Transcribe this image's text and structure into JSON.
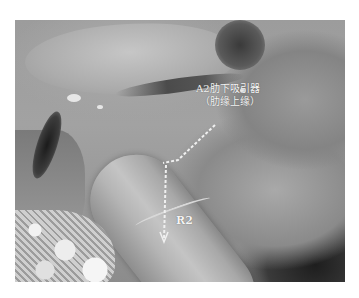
{
  "image": {
    "description": "Grayscale laparoscopic surgical photograph with annotation",
    "annotations": {
      "label_a2_line1": "A2肋下吸引器",
      "label_a2_line2": "（肋缘上缘）",
      "label_r2": "R2"
    },
    "arrow": {
      "style": "dashed",
      "color": "#f0f0f0",
      "points": [
        [
          215,
          125
        ],
        [
          180,
          158
        ],
        [
          178,
          160
        ],
        [
          175,
          240
        ]
      ]
    },
    "colors": {
      "background": "#ffffff",
      "tissue_mid": "#9c9c9c",
      "tissue_light": "#c4c4c4",
      "shadow": "#1e1e1e",
      "annotation_text": "#f4f4f4"
    },
    "caption_cut": "··· ··· ····· ·· ····· ··· ····· ··"
  }
}
